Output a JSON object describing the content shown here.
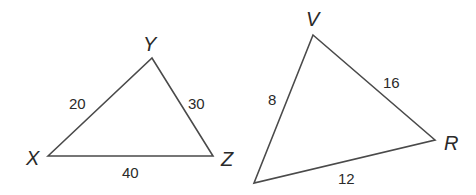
{
  "triangles": [
    {
      "name": "XYZ",
      "vertices": {
        "X": {
          "label": "X",
          "x": 48,
          "y": 156
        },
        "Y": {
          "label": "Y",
          "x": 152,
          "y": 58
        },
        "Z": {
          "label": "Z",
          "x": 213,
          "y": 156
        }
      },
      "sides": {
        "XY": "20",
        "YZ": "30",
        "XZ": "40"
      }
    },
    {
      "name": "VR-triangle",
      "vertices": {
        "V": {
          "label": "V",
          "x": 313,
          "y": 35
        },
        "R": {
          "label": "R",
          "x": 435,
          "y": 140
        },
        "bottom": {
          "label": "",
          "x": 254,
          "y": 183
        }
      },
      "sides": {
        "V_bottom": "8",
        "VR": "16",
        "R_bottom": "12"
      }
    }
  ],
  "colors": {
    "stroke": "#4a4a4a",
    "text": "#2a2a2a",
    "background": "#ffffff"
  }
}
